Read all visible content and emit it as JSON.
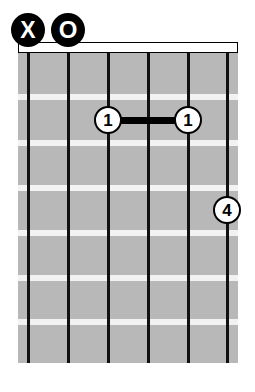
{
  "diagram": {
    "instrument": "guitar",
    "string_count": 6,
    "fret_count": 7,
    "starting_fret": 1,
    "board_color": "#b8b8b8",
    "string_color": "#111111",
    "fret_color": "#f2f2f2",
    "marker_fill": "#000000",
    "dot_fill": "#ffffff",
    "background": "#ffffff"
  },
  "geometry": {
    "board": {
      "left": 18,
      "top": 52,
      "width": 220,
      "height": 311
    },
    "nut": {
      "left": 18,
      "top": 42,
      "width": 220,
      "height": 11
    },
    "string_x": [
      28,
      68,
      108,
      148,
      188,
      227
    ],
    "fret_y": [
      97,
      143,
      188,
      233,
      278,
      322
    ],
    "string_width": 3,
    "fret_height": 6
  },
  "open_markers": [
    {
      "symbol": "X",
      "label": "muted-string",
      "string_index": 0,
      "cx": 28,
      "cy": 30,
      "size": 34,
      "kind": "muted"
    },
    {
      "symbol": "O",
      "label": "open-string",
      "string_index": 1,
      "cx": 68,
      "cy": 30,
      "size": 34,
      "kind": "open"
    }
  ],
  "finger_dots": [
    {
      "finger": "1",
      "string_index": 2,
      "fret": 2,
      "cx": 108,
      "cy": 120,
      "size": 28
    },
    {
      "finger": "1",
      "string_index": 4,
      "fret": 2,
      "cx": 188,
      "cy": 120,
      "size": 28
    },
    {
      "finger": "4",
      "string_index": 5,
      "fret": 4,
      "cx": 227,
      "cy": 210,
      "size": 28
    }
  ],
  "barres": [
    {
      "finger": "1",
      "fret": 2,
      "from_x": 108,
      "to_x": 188,
      "cy": 120,
      "thickness": 7
    }
  ]
}
